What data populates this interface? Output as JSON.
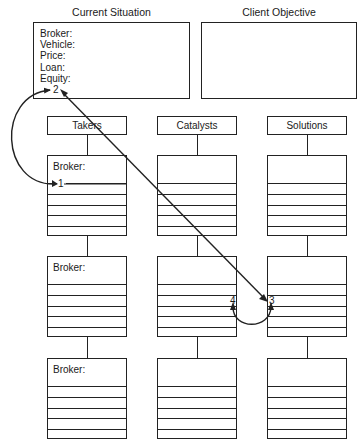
{
  "top_section": {
    "current_situation": {
      "title": "Current Situation",
      "fields": [
        "Broker:",
        "Vehicle:",
        "Price:",
        "Loan:",
        "Equity:"
      ],
      "marker": "2"
    },
    "client_objective": {
      "title": "Client Objective"
    }
  },
  "columns": [
    {
      "header": "Takers"
    },
    {
      "header": "Catalysts"
    },
    {
      "header": "Solutions"
    }
  ],
  "grid": {
    "rows": [
      {
        "takers_label": "Broker:",
        "catalysts_label": "",
        "solutions_label": ""
      },
      {
        "takers_label": "Broker:",
        "catalysts_label": "",
        "solutions_label": ""
      },
      {
        "takers_label": "Broker:",
        "catalysts_label": "",
        "solutions_label": ""
      }
    ],
    "lines_per_box": 5
  },
  "markers": {
    "one": "1",
    "two": "2",
    "three": "3",
    "four": "4"
  },
  "colors": {
    "line": "#222222",
    "background": "#ffffff"
  }
}
